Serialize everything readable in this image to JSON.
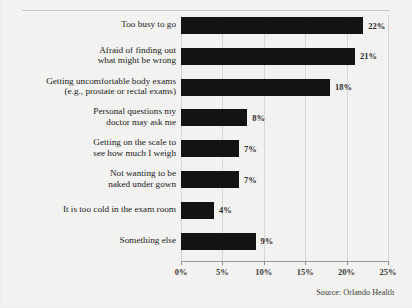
{
  "chart_data": {
    "type": "bar",
    "orientation": "horizontal",
    "title": "",
    "xlabel": "",
    "ylabel": "",
    "xlim": [
      0,
      25
    ],
    "grid": true,
    "legend": null,
    "categories": [
      "Too busy to go",
      "Afraid of finding out\nwhat might be wrong",
      "Getting uncomfortable body exams\n(e.g., prostate or rectal exams)",
      "Personal questions my\ndoctor may ask me",
      "Getting on the scale to\nsee how much I weigh",
      "Not wanting to be\nnaked under gown",
      "It is too cold in the exam room",
      "Something else"
    ],
    "values": [
      22,
      21,
      18,
      8,
      7,
      7,
      4,
      9
    ],
    "data_labels": [
      "22%",
      "21%",
      "18%",
      "8%",
      "7%",
      "7%",
      "4%",
      "9%"
    ],
    "xticks": [
      0,
      5,
      10,
      15,
      20,
      25
    ],
    "xtick_labels": [
      "0%",
      "5%",
      "10%",
      "15%",
      "20%",
      "25%"
    ],
    "bar_color": "#131313",
    "background_color": "#f2f2f0",
    "gridline_color": "#d6d6d2"
  },
  "rows": [
    {
      "label_line1": "Too busy to go",
      "label_line2": "",
      "value_label": "22%"
    },
    {
      "label_line1": "Afraid of finding out",
      "label_line2": "what might be wrong",
      "value_label": "21%"
    },
    {
      "label_line1": "Getting uncomfortable body exams",
      "label_line2": "(e.g., prostate or rectal exams)",
      "value_label": "18%"
    },
    {
      "label_line1": "Personal questions my",
      "label_line2": "doctor may ask me",
      "value_label": "8%"
    },
    {
      "label_line1": "Getting on the scale to",
      "label_line2": "see how much I weigh",
      "value_label": "7%"
    },
    {
      "label_line1": "Not wanting to be",
      "label_line2": "naked under gown",
      "value_label": "7%"
    },
    {
      "label_line1": "It is too cold in the exam room",
      "label_line2": "",
      "value_label": "4%"
    },
    {
      "label_line1": "Something else",
      "label_line2": "",
      "value_label": "9%"
    }
  ],
  "footer": {
    "source": "Source: Orlando Health"
  },
  "cropped_title": ""
}
